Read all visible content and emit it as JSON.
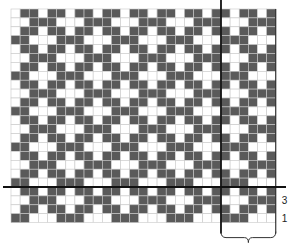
{
  "diagram": {
    "type": "weave-chart",
    "grid": {
      "columns": 29,
      "rows": 24,
      "origin_x": 11,
      "origin_y": 9,
      "cell_width": 9.13,
      "cell_height": 8.9,
      "column_offset": 1,
      "row_offset": 0
    },
    "repeat": {
      "columns": 6,
      "rows": 4,
      "pattern": [
        "DWDDWD",
        "WWWDDD",
        "DWDDWD",
        "DDDWWW"
      ]
    },
    "colors": {
      "dark": "#5a5a5a",
      "light": "#ffffff",
      "grid_line": "#c8c8c8",
      "marker_line": "#111111"
    },
    "markers": {
      "vertical_line_after_column": 23,
      "horizontal_line_after_row": 20
    },
    "row_labels": [
      {
        "text": "3",
        "row_from_bottom": 3
      },
      {
        "text": "1",
        "row_from_bottom": 1
      }
    ],
    "bracket": {
      "from_column": 23,
      "to_column": 29,
      "label": ""
    }
  }
}
